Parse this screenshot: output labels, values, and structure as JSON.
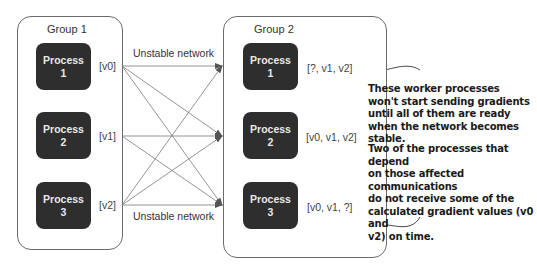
{
  "group1": {
    "title": "Group 1",
    "processes": [
      {
        "name": "Process",
        "num": "1",
        "value": "[v0]"
      },
      {
        "name": "Process",
        "num": "2",
        "value": "[v1]"
      },
      {
        "name": "Process",
        "num": "3",
        "value": "[v2]"
      }
    ]
  },
  "group2": {
    "title": "Group 2",
    "processes": [
      {
        "name": "Process",
        "num": "1",
        "value": "[?, v1, v2]"
      },
      {
        "name": "Process",
        "num": "2",
        "value": "[v0, v1, v2]"
      },
      {
        "name": "Process",
        "num": "3",
        "value": "[v0, v1, ?]"
      }
    ]
  },
  "network": {
    "top_label": "Unstable network",
    "bottom_label": "Unstable network"
  },
  "annotations": {
    "note1": [
      "These worker processes",
      "won't start sending gradients",
      "until all of them are ready",
      "when the network becomes stable."
    ],
    "note2": [
      "Two of the processes that depend",
      "on those affected communications",
      "do not receive some of the",
      "calculated gradient values (v0 and",
      "v2) on time."
    ]
  },
  "colors": {
    "process_fill": "#2e2e2e",
    "process_text": "#e8e8e8",
    "line": "#7a7a7a",
    "border": "#6b6b6b"
  }
}
